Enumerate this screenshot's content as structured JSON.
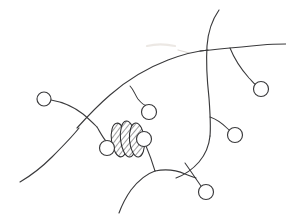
{
  "figure": {
    "medium": "pencil line drawing on white paper",
    "background_color": "#ffffff",
    "ink_color": "#3a3a3c",
    "smudge_color": "#ddd7d1",
    "width": 286,
    "height": 216
  },
  "chart_data": {
    "type": "diagram",
    "elements": {
      "branch_count": 11,
      "terminal_circle_count": 7,
      "hatched_ellipse_count": 3
    },
    "terminal_circles": [
      {
        "name": "left-terminal",
        "cx": 44,
        "cy": 99,
        "r": 7
      },
      {
        "name": "upper-mid-terminal",
        "cx": 149,
        "cy": 112,
        "r": 7.5
      },
      {
        "name": "vesicle-left-terminal",
        "cx": 107,
        "cy": 148,
        "r": 7.5
      },
      {
        "name": "vesicle-right-terminal",
        "cx": 144,
        "cy": 139,
        "r": 7.5
      },
      {
        "name": "upper-right-terminal",
        "cx": 261,
        "cy": 89,
        "r": 7.5
      },
      {
        "name": "mid-right-terminal",
        "cx": 235,
        "cy": 135,
        "r": 7.5
      },
      {
        "name": "bottom-terminal",
        "cx": 206,
        "cy": 192,
        "r": 7.5
      }
    ],
    "hatched_ellipses": [
      {
        "name": "vesicle-1",
        "cx": 119,
        "cy": 140,
        "rx": 7.5,
        "ry": 17,
        "rotation": -8
      },
      {
        "name": "vesicle-2",
        "cx": 128,
        "cy": 139,
        "rx": 7.5,
        "ry": 18,
        "rotation": -6
      },
      {
        "name": "vesicle-3",
        "cx": 137,
        "cy": 140,
        "rx": 7.5,
        "ry": 17,
        "rotation": -5
      }
    ],
    "strokes": [
      {
        "name": "upper-long-arc",
        "role": "soma upper border"
      },
      {
        "name": "vertical-axon",
        "role": "vertical fiber crossing top"
      },
      {
        "name": "horizontal-fiber",
        "role": "horizontal fiber to right edge"
      },
      {
        "name": "lower-left-process",
        "role": "descending left process"
      },
      {
        "name": "right-body-curve",
        "role": "right soma border"
      },
      {
        "name": "bottom-process",
        "role": "descending bottom process"
      }
    ]
  }
}
